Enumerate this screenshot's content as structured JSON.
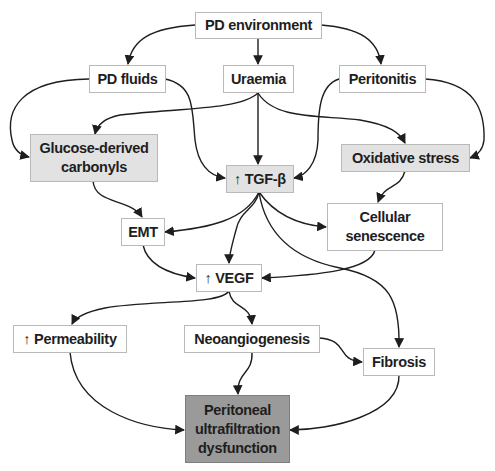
{
  "diagram": {
    "colors": {
      "edge": "#1e1e1e",
      "box_border": "#b9b9b9",
      "shaded_fill": "#e2e2e2",
      "outcome_fill": "#9a9a9a"
    },
    "nodes": {
      "pd_environment": "PD environment",
      "pd_fluids": "PD fluids",
      "uraemia": "Uraemia",
      "peritonitis": "Peritonitis",
      "glucose_carbonyls": "Glucose-derived carbonyls",
      "tgf_beta": "↑ TGF-β",
      "oxidative_stress": "Oxidative stress",
      "cellular_senescence": "Cellular senescence",
      "emt": "EMT",
      "vegf": "↑ VEGF",
      "permeability": "↑ Permeability",
      "neoangiogenesis": "Neoangiogenesis",
      "fibrosis": "Fibrosis",
      "outcome": "Peritoneal ultrafiltration dysfunction"
    },
    "edges": [
      [
        "pd_environment",
        "pd_fluids"
      ],
      [
        "pd_environment",
        "uraemia"
      ],
      [
        "pd_environment",
        "peritonitis"
      ],
      [
        "pd_fluids",
        "glucose_carbonyls"
      ],
      [
        "pd_fluids",
        "tgf_beta"
      ],
      [
        "uraemia",
        "glucose_carbonyls"
      ],
      [
        "uraemia",
        "tgf_beta"
      ],
      [
        "uraemia",
        "oxidative_stress"
      ],
      [
        "peritonitis",
        "tgf_beta"
      ],
      [
        "peritonitis",
        "oxidative_stress"
      ],
      [
        "glucose_carbonyls",
        "emt"
      ],
      [
        "oxidative_stress",
        "cellular_senescence"
      ],
      [
        "tgf_beta",
        "emt"
      ],
      [
        "tgf_beta",
        "vegf"
      ],
      [
        "tgf_beta",
        "cellular_senescence"
      ],
      [
        "tgf_beta",
        "fibrosis"
      ],
      [
        "emt",
        "vegf"
      ],
      [
        "cellular_senescence",
        "vegf"
      ],
      [
        "vegf",
        "permeability"
      ],
      [
        "vegf",
        "neoangiogenesis"
      ],
      [
        "neoangiogenesis",
        "fibrosis"
      ],
      [
        "neoangiogenesis",
        "outcome"
      ],
      [
        "permeability",
        "outcome"
      ],
      [
        "fibrosis",
        "outcome"
      ]
    ]
  }
}
